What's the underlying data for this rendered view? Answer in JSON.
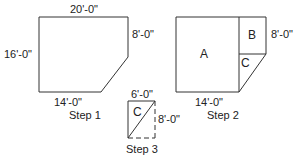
{
  "step1": {
    "caption": "Step 1",
    "dims": {
      "top": "20'-0\"",
      "left": "16'-0\"",
      "right": "8'-0\"",
      "bottom": "14'-0\""
    }
  },
  "step2": {
    "caption": "Step 2",
    "regions": [
      "A",
      "B",
      "C"
    ],
    "dims": {
      "right": "8'-0\"",
      "bottom": "14'-0\""
    }
  },
  "step3": {
    "caption": "Step 3",
    "region": "C",
    "dims": {
      "top": "6'-0\"",
      "right": "8'-0\""
    }
  },
  "colors": {
    "line": "#333333",
    "text": "#222222"
  }
}
